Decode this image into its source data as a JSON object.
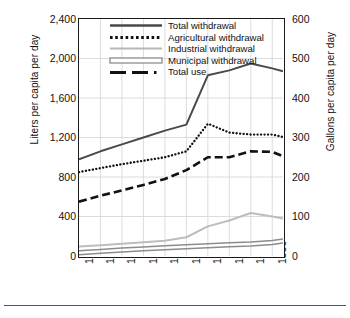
{
  "figure": {
    "name": "water-withdrawal-and-use-per-capita"
  },
  "axes": {
    "left_title": "Liters per capita per day",
    "right_title": "Gallons per capita per day",
    "left_ticks": [
      "0",
      "400",
      "800",
      "1,200",
      "1,600",
      "2,000",
      "2,400"
    ],
    "right_ticks": [
      "0",
      "100",
      "200",
      "300",
      "400",
      "500",
      "600"
    ],
    "x_ticks": [
      "1900",
      "1910",
      "1920",
      "1930",
      "1940",
      "1950",
      "1960",
      "1970",
      "1980",
      "1990"
    ]
  },
  "legend": {
    "position": "inside-top-left",
    "items": [
      {
        "label": "Total withdrawal",
        "style": "solid-dark",
        "color": "#4a4a4a"
      },
      {
        "label": "Agricultural withdrawal",
        "style": "dotted",
        "color": "#111111"
      },
      {
        "label": "Industrial withdrawal",
        "style": "solid-light",
        "color": "#b8b8b8"
      },
      {
        "label": "Municipal withdrawal",
        "style": "outlined-bar",
        "color": "#8c8c8c"
      },
      {
        "label": "Total use",
        "style": "dash-dot",
        "color": "#111111"
      }
    ]
  },
  "chart_data": {
    "type": "line",
    "title": "",
    "subtitle": "",
    "xlabel": "",
    "ylabel": "Liters per capita per day",
    "y2label": "Gallons per capita per day",
    "xlim": [
      1900,
      1995
    ],
    "ylim": [
      0,
      2400
    ],
    "y2lim": [
      0,
      600
    ],
    "grid": true,
    "x": [
      1900,
      1910,
      1920,
      1930,
      1940,
      1950,
      1960,
      1970,
      1980,
      1990,
      1995
    ],
    "series": [
      {
        "name": "Total withdrawal",
        "style": "solid-dark",
        "color": "#4a4a4a",
        "units": "liters per capita per day",
        "values": [
          980,
          1060,
          1130,
          1200,
          1270,
          1330,
          1830,
          1880,
          1950,
          1900,
          1870
        ]
      },
      {
        "name": "Agricultural withdrawal",
        "style": "dotted",
        "color": "#111111",
        "units": "liters per capita per day",
        "values": [
          850,
          890,
          930,
          965,
          1000,
          1060,
          1340,
          1250,
          1230,
          1230,
          1205
        ]
      },
      {
        "name": "Industrial withdrawal",
        "style": "solid-light",
        "color": "#b8b8b8",
        "units": "liters per capita per day",
        "values": [
          95,
          110,
          125,
          140,
          155,
          190,
          300,
          360,
          435,
          400,
          380
        ]
      },
      {
        "name": "Municipal withdrawal",
        "style": "outlined-bar",
        "color": "#8c8c8c",
        "units": "liters per capita per day",
        "values": [
          30,
          45,
          58,
          70,
          82,
          92,
          102,
          112,
          120,
          135,
          150
        ]
      },
      {
        "name": "Total use",
        "style": "dash-dot",
        "color": "#111111",
        "units": "liters per capita per day",
        "values": [
          550,
          610,
          665,
          720,
          780,
          870,
          1000,
          1000,
          1060,
          1055,
          1010
        ]
      }
    ]
  }
}
